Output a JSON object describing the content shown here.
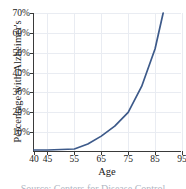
{
  "chart_data": {
    "type": "line",
    "title": "",
    "xlabel": "Age",
    "ylabel": "Percentage with Alzheimer's",
    "xlim": [
      40,
      95
    ],
    "ylim": [
      0,
      70
    ],
    "grid": true,
    "legend": "none",
    "line_color": "#3d5a8a",
    "x_ticks": [
      40,
      45,
      55,
      65,
      75,
      85,
      95
    ],
    "x_tick_labels": [
      "40",
      "45",
      "55",
      "65",
      "75",
      "85",
      "95"
    ],
    "y_ticks": [
      10,
      20,
      30,
      40,
      50,
      60,
      70
    ],
    "y_tick_labels": [
      "10%",
      "20%",
      "30%",
      "40%",
      "50%",
      "60%",
      "70%"
    ],
    "x": [
      40,
      45,
      55,
      60,
      65,
      70,
      75,
      80,
      85,
      88
    ],
    "values": [
      1,
      1,
      1.5,
      4,
      8,
      13,
      20,
      33,
      52,
      70
    ],
    "series": [
      {
        "name": "Percentage with Alzheimer's",
        "x": [
          40,
          45,
          55,
          60,
          65,
          70,
          75,
          80,
          85,
          88
        ],
        "values": [
          1,
          1,
          1.5,
          4,
          8,
          13,
          20,
          33,
          52,
          70
        ]
      }
    ]
  },
  "caption": {
    "text": "Source: Centers for Disease Control"
  }
}
